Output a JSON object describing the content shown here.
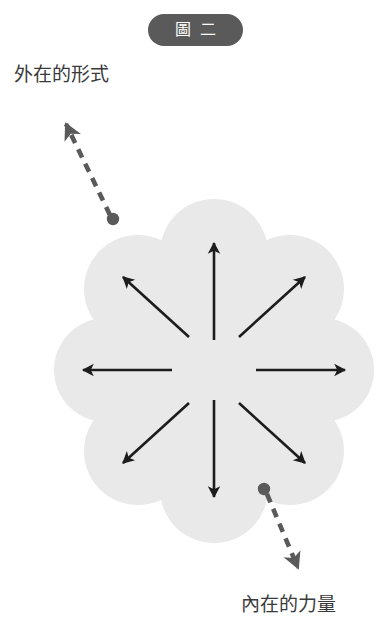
{
  "figure_badge": {
    "char_1": "圖",
    "char_2": "二",
    "full_label": "圖二",
    "background_color": "#5a5a5a",
    "text_color": "#ffffff"
  },
  "labels": {
    "outer_form": "外在的形式",
    "inner_power": "內在的力量"
  },
  "colors": {
    "page_background": "#ffffff",
    "blob_fill": "#e9e9e9",
    "arrow_color": "#1c1c1c",
    "leader_color": "#5a5a5a",
    "label_text": "#3a3a3a",
    "badge_fill": "#5a5a5a"
  },
  "blob": {
    "shape_name": "scalloped-flower",
    "petal_count": 8,
    "center_x": 214,
    "center_y": 370,
    "radius_x": 143,
    "radius_y": 165
  },
  "radial_arrows": {
    "count": 8,
    "description": "eight arrows radiating outward from the centre of the blob",
    "directions": [
      "up",
      "up-right",
      "right",
      "down-right",
      "down",
      "down-left",
      "left",
      "up-left"
    ]
  },
  "leaders": [
    {
      "name": "outer-form-leader",
      "label": "外在的形式",
      "dot_x": 113,
      "dot_y": 219,
      "arrow_x": 60,
      "arrow_y": 110,
      "style": "dashed"
    },
    {
      "name": "inner-power-leader",
      "label": "內在的力量",
      "dot_x": 264,
      "dot_y": 489,
      "arrow_x": 303,
      "arrow_y": 580,
      "style": "dashed"
    }
  ]
}
